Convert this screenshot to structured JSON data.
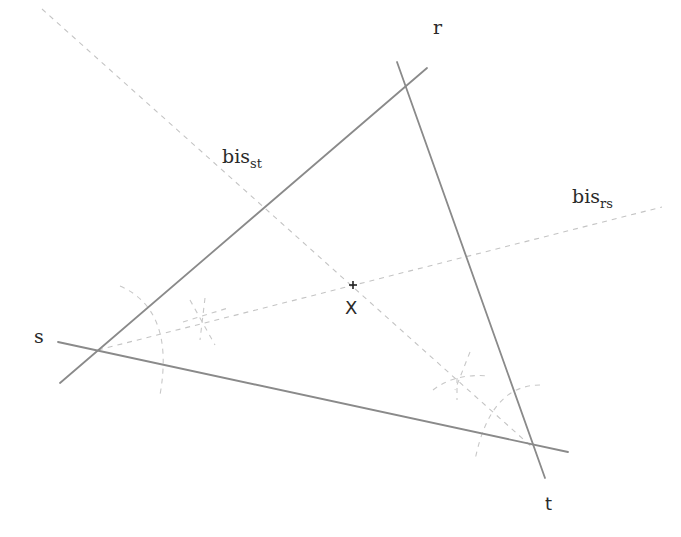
{
  "diagram": {
    "lines": [
      {
        "name": "r",
        "label": "r",
        "style": "solid"
      },
      {
        "name": "s",
        "label": "s",
        "style": "solid"
      },
      {
        "name": "t",
        "label": "t",
        "style": "solid"
      }
    ],
    "bisectors": [
      {
        "name": "bis_st",
        "base": "bis",
        "subscript": "st",
        "style": "dashed"
      },
      {
        "name": "bis_rs",
        "base": "bis",
        "subscript": "rs",
        "style": "dashed"
      }
    ],
    "point": {
      "name": "X",
      "label": "X",
      "marker": "+"
    },
    "colors": {
      "solid_line": "#8a8a8a",
      "dashed_line": "#c4c4c4",
      "text": "#2a2a2a",
      "background": "#ffffff"
    }
  }
}
